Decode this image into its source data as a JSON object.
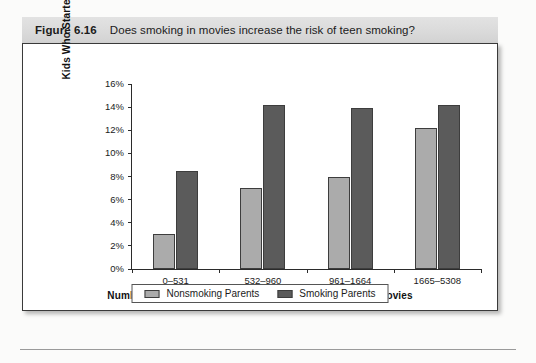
{
  "figure": {
    "number": "Figure 6.16",
    "caption": "Does smoking in movies increase the risk of teen smoking?"
  },
  "colors": {
    "nonsmoking_parents": "#ababab",
    "smoking_parents": "#5b5b5b",
    "header_band": "#dcdcdc",
    "panel_border": "#3a3a3a",
    "axis": "#2b2b2b"
  },
  "chart_data": {
    "type": "bar",
    "title": "Does smoking in movies increase the risk of teen smoking?",
    "xlabel": "Number of Smoking Incidents Kids Saw in 600 Popular Movies",
    "ylabel": "Kids Who Started Smoking",
    "categories": [
      "0–531",
      "532–960",
      "961–1664",
      "1665–5308"
    ],
    "series": [
      {
        "name": "Nonsmoking Parents",
        "color": "#ababab",
        "values": [
          3.0,
          7.0,
          8.0,
          12.2
        ]
      },
      {
        "name": "Smoking Parents",
        "color": "#5b5b5b",
        "values": [
          8.5,
          14.2,
          13.9,
          14.2
        ]
      }
    ],
    "ylim": [
      0,
      16
    ],
    "ytick_step": 2,
    "ytick_labels": [
      "0%",
      "2%",
      "4%",
      "6%",
      "8%",
      "10%",
      "12%",
      "14%",
      "16%"
    ],
    "ytick_values": [
      0,
      2,
      4,
      6,
      8,
      10,
      12,
      14,
      16
    ],
    "grid": false,
    "legend_position": "bottom"
  }
}
